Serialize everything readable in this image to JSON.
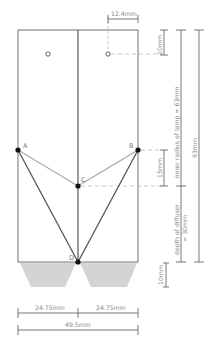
{
  "diagram": {
    "title_clipped": "",
    "colors": {
      "outline": "#6f6f6f",
      "divider": "#555555",
      "light_line": "#aaaaaa",
      "dark_line": "#555555",
      "point": "#111111",
      "diffuser_fill": "#d2d2d2",
      "dashed": "#bbbbbb",
      "text": "#888888"
    },
    "points": [
      {
        "id": "A",
        "label": "A"
      },
      {
        "id": "B",
        "label": "B"
      },
      {
        "id": "C",
        "label": "C"
      },
      {
        "id": "D",
        "label": "D"
      }
    ],
    "dimensions": {
      "hole_offset": "12.4mm",
      "top_to_hole": "10mm",
      "inner_radius": "inner radius of lamp = 63mm",
      "ab_to_c": "15mm",
      "total_height": "93mm",
      "diffuser_depth_line1": "depth of diffuser",
      "diffuser_depth_line2": "= 30mm",
      "bottom_extension": "10mm",
      "half_width_left": "24.75mm",
      "half_width_right": "24.75mm",
      "full_width": "49.5mm"
    }
  }
}
